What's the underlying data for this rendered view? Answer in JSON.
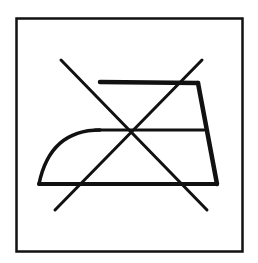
{
  "symbol": {
    "name": "do-not-iron",
    "description": "Do not iron",
    "stroke_color": "#111111",
    "background_color": "#ffffff"
  }
}
